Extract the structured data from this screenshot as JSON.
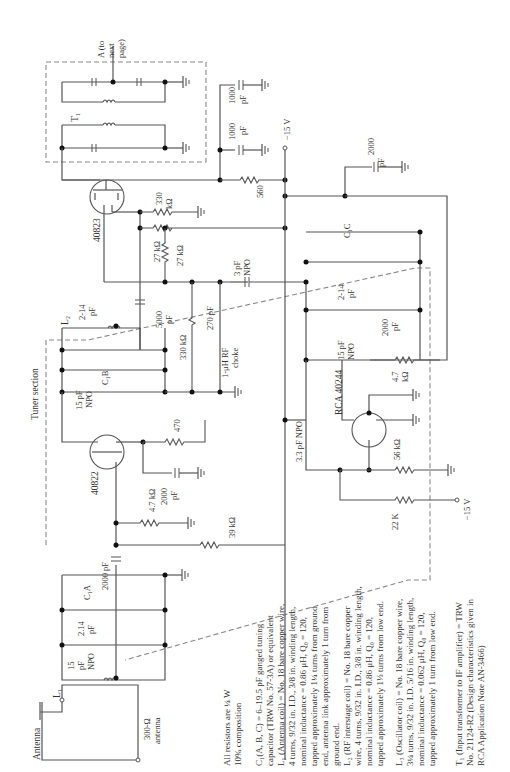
{
  "figure": {
    "orientation": "rotated-90-ccw",
    "section_label": "Tuner section",
    "output_label": "A (to next page)",
    "output_label_lines": [
      "A (to",
      "next",
      "page)"
    ]
  },
  "components": {
    "antenna": {
      "label": "Antenna",
      "impedance": "300-Ω",
      "impedance_sub": "antenna"
    },
    "L1": {
      "label": "L₁"
    },
    "L2": {
      "label": "L₂"
    },
    "T1": {
      "label": "T₁"
    },
    "C1A": {
      "label": "C₁A"
    },
    "C1B": {
      "label": "C₁B"
    },
    "C1C": {
      "label": "C₁C"
    },
    "q1": {
      "label": "40822",
      "type": "MOSFET"
    },
    "q2": {
      "label": "40823",
      "type": "MOSFET"
    },
    "q3": {
      "label": "RCA 40244",
      "type": "BJT"
    },
    "capacitors": [
      {
        "id": "c_ant_trim",
        "value": "15 pF NPO",
        "lines": [
          "15",
          "pF",
          "NPO"
        ]
      },
      {
        "id": "c_ant_var",
        "value": "2-14 pF",
        "lines": [
          "2.14",
          "pF"
        ]
      },
      {
        "id": "c_coupling_in",
        "value": "2000 pF"
      },
      {
        "id": "c_gate_bypass",
        "value": "2000 pF",
        "lines": [
          "2000",
          "pF"
        ]
      },
      {
        "id": "c_rf_trim",
        "value": "15 pF NPO",
        "lines": [
          "15 pF",
          "NPO"
        ]
      },
      {
        "id": "c_rf_var",
        "value": "2-14 pF",
        "lines": [
          "2-14",
          "pF"
        ]
      },
      {
        "id": "c_5000",
        "value": "5000 pF",
        "lines": [
          "5000",
          "pF"
        ]
      },
      {
        "id": "c_270",
        "value": "270 pF"
      },
      {
        "id": "c_3pf",
        "value": "3 pF NPO",
        "lines": [
          "3 pF",
          "NPO"
        ]
      },
      {
        "id": "c_33pf",
        "value": "3.3 pF NPO"
      },
      {
        "id": "c_osc_trim",
        "value": "15 pF NPO",
        "lines": [
          "15 pF",
          "NPO"
        ]
      },
      {
        "id": "c_osc_var",
        "value": "2-14 pF",
        "lines": [
          "2-14",
          "pF"
        ]
      },
      {
        "id": "c_osc_2000",
        "value": "2000 pF",
        "lines": [
          "2000",
          "pF"
        ]
      },
      {
        "id": "c_supply_2000",
        "value": "2000 pF",
        "lines": [
          "2000",
          "pF"
        ]
      },
      {
        "id": "c_1000a",
        "value": "1000 pF",
        "lines": [
          "1000",
          "pF"
        ]
      },
      {
        "id": "c_1000b",
        "value": "1000 pF",
        "lines": [
          "1000",
          "pF"
        ]
      }
    ],
    "resistors": [
      {
        "id": "r_39k",
        "value": "39 kΩ"
      },
      {
        "id": "r_47k_a",
        "value": "4.7 kΩ"
      },
      {
        "id": "r_470",
        "value": "470"
      },
      {
        "id": "r_330k_a",
        "value": "330 kΩ"
      },
      {
        "id": "r_330k_b",
        "value": "330 kΩ",
        "lines": [
          "330",
          "kΩ"
        ]
      },
      {
        "id": "r_27k_a",
        "value": "27 kΩ"
      },
      {
        "id": "r_27k_b",
        "value": "27 kΩ"
      },
      {
        "id": "r_560",
        "value": "560"
      },
      {
        "id": "r_47k_b",
        "value": "4.7 kΩ",
        "lines": [
          "4.7",
          "kΩ"
        ]
      },
      {
        "id": "r_56k",
        "value": "56 kΩ"
      },
      {
        "id": "r_22k",
        "value": "22 K"
      }
    ],
    "choke": {
      "value": "1-μH RF choke",
      "lines": [
        "1-μH RF",
        "choke"
      ]
    },
    "supplies": [
      {
        "id": "v1",
        "value": "−15 V"
      },
      {
        "id": "v2",
        "value": "−15 V"
      }
    ]
  },
  "notes": {
    "resistors": [
      "All resistors are ¼ W",
      "10% composition"
    ],
    "c1": [
      "C₁(A, B, C) = 6–19.5 pF ganged tuning",
      "capacitor (TRW No. 57-3A) or equivalent"
    ],
    "l1": [
      "L₁ (Antenna coil) = No. 18 bare copper wire,",
      "4 turns, 9/32 in. I.D., 3/8 in. winding length,",
      "nominal inductance = 0.86 μH, Q₀ = 120,",
      "tapped approximately 1¼ turns from ground",
      "end, antenna link approximately 1 turn from",
      "ground end."
    ],
    "l2": [
      "L₂ (RF interstage coil) = No. 18 bare copper",
      "wire, 4 turns, 9/32 in. I.D., 3/8 in. winding length,",
      "nominal inductance = 0.86 μH, Q₀ = 120,",
      "tapped approximately 1½ turns from low end."
    ],
    "l3": [
      "L₃ (Oscillator coil) = No. 18 bare copper wire,",
      "3¼ turns, 9/32 in. I.D. 5/16 in. winding length,",
      "nominal inductance = 0.062 μH, Q₀ = 120,",
      "tapped approximately 1 turn from low end."
    ],
    "t1": [
      "T₁ (Input transformer to IF amplifier) = TRW",
      "No. 21124-R2 (Design characteristics given in",
      "RCA Application Note AN-3466)"
    ]
  }
}
